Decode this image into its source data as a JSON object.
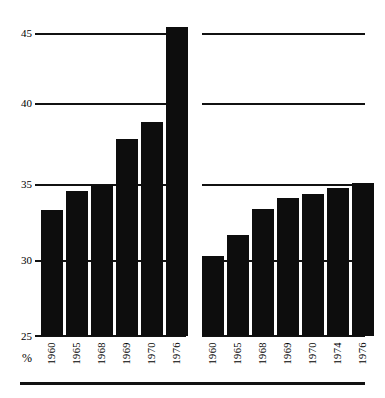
{
  "chart_data": {
    "type": "bar",
    "title": "",
    "subtitle": "",
    "xlabel": "",
    "ylabel": "%",
    "ylim": [
      25,
      45
    ],
    "yticks": [
      25,
      30,
      35,
      40,
      45
    ],
    "grid": true,
    "legend": "none",
    "panels": [
      {
        "name": "left-panel",
        "categories": [
          "1960",
          "1965",
          "1968",
          "1969",
          "1970",
          "1976"
        ],
        "values": [
          33.3,
          34.6,
          35.0,
          38.0,
          39.1,
          45.4
        ]
      },
      {
        "name": "right-panel",
        "categories": [
          "1960",
          "1965",
          "1968",
          "1969",
          "1970",
          "1974",
          "1976"
        ],
        "values": [
          30.3,
          31.7,
          33.4,
          34.1,
          34.4,
          34.8,
          35.1
        ]
      }
    ]
  },
  "axis": {
    "unit_symbol": "%",
    "tick_labels": [
      "45",
      "40",
      "35",
      "30",
      "25"
    ]
  },
  "colors": {
    "bar": "#0d0d0d",
    "gridline": "#111111",
    "background": "#ffffff",
    "text": "#000000"
  }
}
